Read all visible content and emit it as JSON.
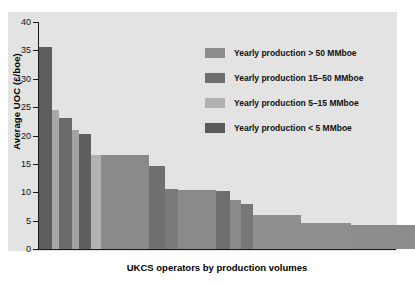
{
  "chart_data": {
    "type": "bar",
    "title": "",
    "xlabel": "UKCS operators by production volumes",
    "ylabel": "Average UOC (£/boe)",
    "ylim": [
      0,
      40
    ],
    "yticks": [
      0,
      5,
      10,
      15,
      20,
      25,
      30,
      35,
      40
    ],
    "grid": false,
    "legend_position": "upper-right-inside",
    "note": "Variable-width cost-curve bar chart: bar width encodes operator production volume, bar height encodes average unit operating cost.",
    "legend": [
      {
        "label": "Yearly production > 50 MMboe",
        "color": "#8c8c8c",
        "key": "gt50"
      },
      {
        "label": "Yearly production 15–50 MMboe",
        "color": "#6e6e6e",
        "key": "15to50"
      },
      {
        "label": "Yearly production 5–15 MMboe",
        "color": "#b0b0b0",
        "key": "5to15"
      },
      {
        "label": "Yearly production < 5 MMboe",
        "color": "#595959",
        "key": "lt5"
      }
    ],
    "categories": [
      "op1",
      "op2",
      "op3",
      "op4",
      "op5",
      "op6",
      "op7",
      "op8",
      "op9",
      "op10",
      "op11",
      "op12",
      "op13",
      "op14",
      "op15",
      "op16"
    ],
    "values": [
      35.6,
      24.5,
      23.0,
      21.0,
      20.2,
      16.6,
      16.5,
      14.6,
      10.6,
      10.4,
      10.2,
      8.6,
      8.0,
      6.0,
      4.6,
      4.3
    ],
    "widths": [
      14,
      7,
      13,
      7,
      12,
      32,
      45,
      12,
      26,
      28,
      10,
      12,
      10,
      42,
      42,
      52
    ],
    "bar_categories": [
      "lt5",
      "5to15",
      "lt5",
      "5to15",
      "lt5",
      "gt50",
      "8c8c8c-wide",
      "lt5",
      "gt50",
      "gt50",
      "lt5",
      "lt5",
      "lt5",
      "8c8c8c",
      "8c8c8c",
      "8c8c8c"
    ],
    "bars": [
      {
        "value": 35.6,
        "width": 14,
        "color": "#5e5e5e"
      },
      {
        "value": 24.5,
        "width": 7,
        "color": "#a8a8a8"
      },
      {
        "value": 23.0,
        "width": 13,
        "color": "#6b6b6b"
      },
      {
        "value": 21.0,
        "width": 7,
        "color": "#a3a3a3"
      },
      {
        "value": 20.2,
        "width": 12,
        "color": "#5f5f5f"
      },
      {
        "value": 16.6,
        "width": 10,
        "color": "#b2b2b2"
      },
      {
        "value": 16.5,
        "width": 48,
        "color": "#8a8a8a"
      },
      {
        "value": 14.6,
        "width": 16,
        "color": "#6f6f6f"
      },
      {
        "value": 10.6,
        "width": 13,
        "color": "#7a7a7a"
      },
      {
        "value": 10.4,
        "width": 38,
        "color": "#8a8a8a"
      },
      {
        "value": 10.2,
        "width": 14,
        "color": "#6e6e6e"
      },
      {
        "value": 8.6,
        "width": 11,
        "color": "#8a8a8a"
      },
      {
        "value": 8.0,
        "width": 12,
        "color": "#777777"
      },
      {
        "value": 6.0,
        "width": 48,
        "color": "#8f8f8f"
      },
      {
        "value": 4.6,
        "width": 50,
        "color": "#8f8f8f"
      },
      {
        "value": 4.3,
        "width": 64,
        "color": "#8c8c8c"
      }
    ]
  },
  "axis": {
    "ylabel": "Average UOC (£/boe)",
    "xlabel": "UKCS operators by production volumes",
    "yticks": [
      "40",
      "35",
      "30",
      "25",
      "20",
      "15",
      "10",
      "5",
      "0"
    ]
  },
  "legend": {
    "items": [
      {
        "label": "Yearly production > 50 MMboe",
        "color": "#8c8c8c"
      },
      {
        "label": "Yearly production 15–50 MMboe",
        "color": "#6e6e6e"
      },
      {
        "label": "Yearly production 5–15 MMboe",
        "color": "#b0b0b0"
      },
      {
        "label": "Yearly production < 5 MMboe",
        "color": "#595959"
      }
    ]
  },
  "colors": {
    "panel": "#e3e3e3",
    "page": "#ffffff",
    "axis": "#1a1a1a"
  }
}
